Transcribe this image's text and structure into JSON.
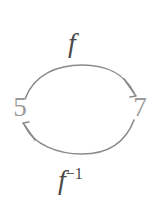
{
  "diagram": {
    "type": "function-inverse-mapping",
    "background_color": "#ffffff",
    "stroke_color": "#8a8a8a",
    "node_color": "#9a9a9a",
    "label_color": "#4a4a4a",
    "nodes": [
      {
        "id": "domain-element",
        "label": "5",
        "x": 20,
        "y": 108
      },
      {
        "id": "codomain-element",
        "label": "7",
        "x": 140,
        "y": 108
      }
    ],
    "edges": [
      {
        "id": "forward-map",
        "label": "f",
        "from": "5",
        "to": "7",
        "direction": "left-to-right",
        "position": "top"
      },
      {
        "id": "inverse-map",
        "label_base": "f",
        "label_exponent": "−1",
        "from": "7",
        "to": "5",
        "direction": "right-to-left",
        "position": "bottom"
      }
    ]
  }
}
